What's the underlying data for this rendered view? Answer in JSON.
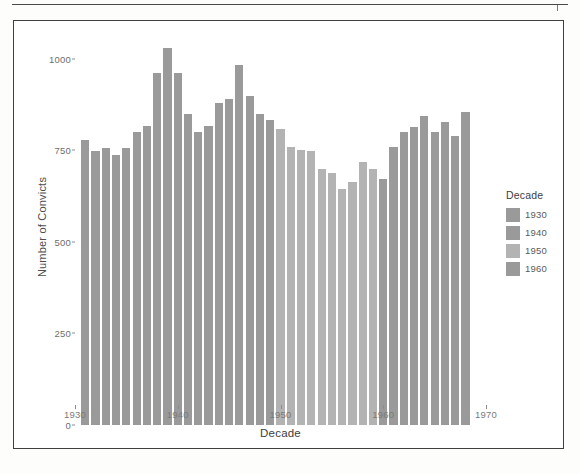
{
  "figure": {
    "frame_visible": true
  },
  "chart_data": {
    "type": "bar",
    "title": "",
    "xlabel": "Decade",
    "ylabel": "Number of Convicts",
    "xlim": [
      1930,
      1970
    ],
    "ylim": [
      0,
      1060
    ],
    "x_ticks": [
      1930,
      1940,
      1950,
      1960,
      1970
    ],
    "y_ticks": [
      0,
      250,
      500,
      750,
      1000
    ],
    "grid": false,
    "legend": {
      "title": "Decade",
      "position": "right",
      "entries": [
        {
          "label": "1930",
          "color": "#9a9a9a"
        },
        {
          "label": "1940",
          "color": "#9a9a9a"
        },
        {
          "label": "1950",
          "color": "#b3b3b3"
        },
        {
          "label": "1960",
          "color": "#9a9a9a"
        }
      ]
    },
    "x": [
      1931,
      1932,
      1933,
      1934,
      1935,
      1936,
      1937,
      1938,
      1939,
      1940,
      1941,
      1942,
      1943,
      1944,
      1945,
      1946,
      1947,
      1948,
      1949,
      1950,
      1951,
      1952,
      1953,
      1954,
      1955,
      1956,
      1957,
      1958,
      1959,
      1960,
      1961,
      1962,
      1963,
      1964,
      1965,
      1966,
      1967,
      1968
    ],
    "values": [
      778,
      749,
      757,
      737,
      757,
      800,
      817,
      963,
      1030,
      962,
      851,
      800,
      817,
      880,
      890,
      983,
      900,
      849,
      832,
      810,
      760,
      750,
      748,
      700,
      688,
      645,
      665,
      718,
      700,
      672,
      760,
      800,
      813,
      845,
      800,
      828,
      790,
      855
    ],
    "groups": [
      {
        "decade": 1930,
        "years": [
          1931,
          1932,
          1933,
          1934,
          1935,
          1936,
          1937,
          1938,
          1939
        ],
        "color": "#9a9a9a"
      },
      {
        "decade": 1940,
        "years": [
          1940,
          1941,
          1942,
          1943,
          1944,
          1945,
          1946,
          1947,
          1948,
          1949
        ],
        "color": "#9a9a9a"
      },
      {
        "decade": 1950,
        "years": [
          1950,
          1951,
          1952,
          1953,
          1954,
          1955,
          1956,
          1957,
          1958,
          1959
        ],
        "color": "#b3b3b3"
      },
      {
        "decade": 1960,
        "years": [
          1960,
          1961,
          1962,
          1963,
          1964,
          1965,
          1966,
          1967,
          1968
        ],
        "color": "#9a9a9a"
      }
    ]
  }
}
